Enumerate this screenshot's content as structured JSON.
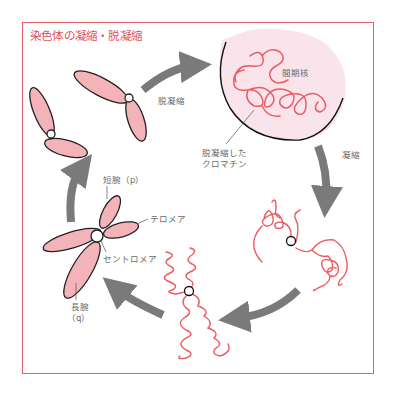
{
  "title": "染色体の凝縮・脱凝縮",
  "colors": {
    "frame": "#e8606a",
    "title": "#e0505a",
    "chromosome_fill": "#f4b3b8",
    "chromatin_strand": "#ee5a62",
    "nucleus_fill": "#f8e4ea",
    "arrow": "#7a7a7a",
    "label_text": "#6a6a6a"
  },
  "stages": [
    {
      "name": "condensed-chromosomes-pair",
      "description": "two condensed chromosomes"
    },
    {
      "name": "interphase-nucleus",
      "label": "間期核"
    },
    {
      "name": "partially-condensed",
      "description": "condensing chromatin"
    },
    {
      "name": "coiled-chromosome",
      "description": "coiled X-shaped chromatin"
    },
    {
      "name": "metaphase-chromosome",
      "description": "X-shaped chromosome"
    }
  ],
  "arrows": {
    "decondense": "脱凝縮",
    "condense": "凝縮"
  },
  "labels": {
    "nucleus": "間期核",
    "decondensed_chromatin_line1": "脱凝縮した",
    "decondensed_chromatin_line2": "クロマチン",
    "short_arm": "短腕（p）",
    "telomere": "テロメア",
    "centromere": "セントロメア",
    "long_arm_line1": "長腕",
    "long_arm_line2": "（q）"
  }
}
